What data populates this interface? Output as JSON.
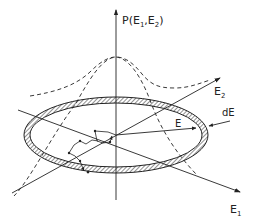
{
  "figure": {
    "type": "diagram",
    "labels": {
      "p_axis_main": "P(E",
      "p_axis_sub1": "1",
      "p_axis_comma": ",E",
      "p_axis_sub2": "2",
      "p_axis_close": ")",
      "e2_main": "E",
      "e2_sub": "2",
      "e1_main": "E",
      "e1_sub": "1",
      "radius": "E",
      "shell_width": "dE"
    },
    "colors": {
      "ink": "#222222",
      "background": "#ffffff"
    }
  }
}
